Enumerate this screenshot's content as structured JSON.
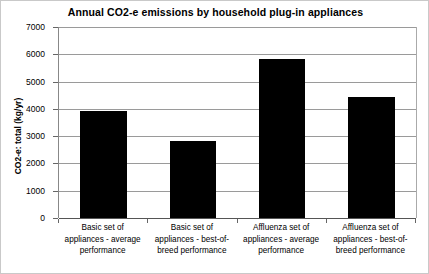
{
  "chart_data": {
    "type": "bar",
    "title": "Annual CO2-e emissions  by household plug-in  appliances",
    "xlabel": "",
    "ylabel": "CO2-e: total (kg/yr)",
    "categories": [
      "Basic set of appliances - average performance",
      "Basic set of appliances - best-of-breed  performance",
      "Affluenza set of appliances - average performance",
      "Affluenza set of appliances - best-of-breed performance"
    ],
    "category_lines": [
      [
        "Basic set of",
        "appliances - average",
        "performance"
      ],
      [
        "Basic set of",
        "appliances - best-of-",
        "breed  performance"
      ],
      [
        "Affluenza set of",
        "appliances - average",
        "performance"
      ],
      [
        "Affluenza set of",
        "appliances - best-of-",
        "breed performance"
      ]
    ],
    "values": [
      3920,
      2830,
      5830,
      4420
    ],
    "ylim": [
      0,
      7000
    ],
    "ytick_labels": [
      "7000",
      "6000",
      "5000",
      "4000",
      "3000",
      "2000",
      "1000",
      "0"
    ],
    "ytick_values": [
      7000,
      6000,
      5000,
      4000,
      3000,
      2000,
      1000,
      0
    ],
    "grid": true,
    "legend": "none",
    "bar_color": "#000000",
    "grid_color": "#9a9a9a",
    "axis_color": "#666666",
    "background": "#ffffff"
  }
}
